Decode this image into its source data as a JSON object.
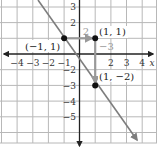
{
  "graph": {
    "colors": {
      "grid": "#b8b8b8",
      "axis": "#222222",
      "line": "#7d7d7d",
      "label_gray": "#999999",
      "point": "#111111",
      "text": "#222222"
    },
    "x_axis_label": "x",
    "x_ticks": [
      {
        "value": -4,
        "label": "−4"
      },
      {
        "value": -3,
        "label": "−3"
      },
      {
        "value": -2,
        "label": "−2"
      },
      {
        "value": -1,
        "label": "−1"
      },
      {
        "value": 2,
        "label": "2"
      },
      {
        "value": 3,
        "label": "3"
      },
      {
        "value": 4,
        "label": "4"
      }
    ],
    "y_ticks": [
      {
        "value": 3,
        "label": "3"
      },
      {
        "value": 2,
        "label": "2"
      },
      {
        "value": -2,
        "label": "−2"
      },
      {
        "value": -3,
        "label": "−3"
      },
      {
        "value": -4,
        "label": "−4"
      },
      {
        "value": -5,
        "label": "−5"
      }
    ],
    "points": [
      {
        "label": "(−1, 1)",
        "x": -1,
        "y": 1
      },
      {
        "label": "(1, 1)",
        "x": 1,
        "y": 1
      },
      {
        "label": "(1, −2)",
        "x": 1,
        "y": -2
      }
    ],
    "run_label": "2",
    "rise_label": "−3"
  }
}
